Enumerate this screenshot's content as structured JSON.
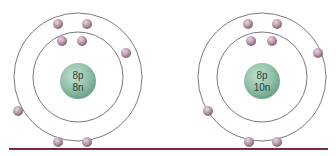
{
  "diagram": {
    "colors": {
      "nucleus": "#8fbfa6",
      "nucleus_dark": "#6a9c84",
      "electron": "#b89aac",
      "electron_dark": "#8a6a7e",
      "orbit": "#6b6b6b",
      "baseline": "#7a2a3a",
      "text": "#2f3e36"
    },
    "atoms": [
      {
        "name": "oxygen-16",
        "center": [
          78,
          77
        ],
        "nucleus": {
          "protons_label": "8p",
          "neutrons_label": "8n"
        },
        "shells": [
          {
            "radius": 45,
            "electrons": 2
          },
          {
            "radius": 63,
            "electrons": 6
          }
        ]
      },
      {
        "name": "oxygen-18",
        "center": [
          266,
          77
        ],
        "nucleus": {
          "protons_label": "8p",
          "neutrons_label": "10n"
        },
        "shells": [
          {
            "radius": 45,
            "electrons": 2
          },
          {
            "radius": 63,
            "electrons": 6
          }
        ]
      }
    ]
  }
}
